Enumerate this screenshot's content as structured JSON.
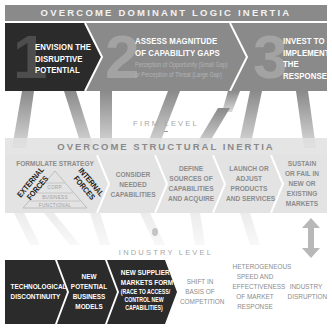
{
  "top_banner": {
    "title": "OVERCOME DOMINANT LOGIC INERTIA"
  },
  "top_steps": [
    {
      "number": "1",
      "lines": [
        "ENVISION THE",
        "DISRUPTIVE",
        "POTENTIAL"
      ]
    },
    {
      "number": "2",
      "lines": [
        "ASSESS MAGNITUDE",
        "OF CAPABILITY GAPS"
      ],
      "sublines": [
        "Perception of Opportunity (Small Gap)",
        "or Perception of  Threat (Large Gap)"
      ]
    },
    {
      "number": "3",
      "lines": [
        "INVEST TO",
        "IMPLEMENT",
        "THE",
        "RESPONSE"
      ]
    }
  ],
  "firm_level": {
    "label": "FIRM LEVEL"
  },
  "mid_banner": {
    "title": "OVERCOME STRUCTURAL INERTIA"
  },
  "mid_steps": [
    {
      "title": "FORMULATE STRATEGY",
      "external_forces": [
        "EXTERNAL",
        "FORCES"
      ],
      "internal_forces": [
        "INTERNAL",
        "FORCES"
      ],
      "pyramid": [
        "CORP.",
        "BUSINESS",
        "FUNCTIONAL"
      ]
    },
    {
      "lines": [
        "CONSIDER",
        "NEEDED",
        "CAPABILITIES"
      ]
    },
    {
      "lines": [
        "DEFINE",
        "SOURCES OF",
        "CAPABILITIES",
        "AND ACQUIRE"
      ]
    },
    {
      "lines": [
        "LAUNCH OR",
        "ADJUST",
        "PRODUCTS",
        "AND SERVICES"
      ]
    },
    {
      "lines": [
        "SUSTAIN",
        "OR FAIL IN",
        "NEW OR",
        "EXISTING",
        "MARKETS"
      ]
    }
  ],
  "industry_level": {
    "label": "INDUSTRY LEVEL"
  },
  "bottom_steps": [
    {
      "lines": [
        "TECHNOLOGICAL",
        "DISCONTINUITY"
      ]
    },
    {
      "lines": [
        "NEW",
        "POTENTIAL",
        "BUSINESS",
        "MODELS"
      ]
    },
    {
      "lines": [
        "NEW SUPPLIER",
        "MARKETS FORM"
      ],
      "sublines": [
        "(RACE TO ACCESS/",
        "CONTROL NEW",
        "CAPABILITIES)"
      ]
    },
    {
      "lines": [
        "SHIFT IN",
        "BASIS OF",
        "COMPETITION"
      ]
    },
    {
      "lines": [
        "HETEROGENEOUS",
        "SPEED AND",
        "EFFECTIVENESS",
        "OF MARKET",
        "RESPONSE"
      ]
    },
    {
      "lines": [
        "INDUSTRY",
        "DISRUPTION"
      ]
    }
  ],
  "colors": {
    "dark": "#2b2b2b",
    "mid_gray": "#8a8a8a",
    "light_gray": "#e3e3e3",
    "ribbon": "#9a9a9a"
  }
}
